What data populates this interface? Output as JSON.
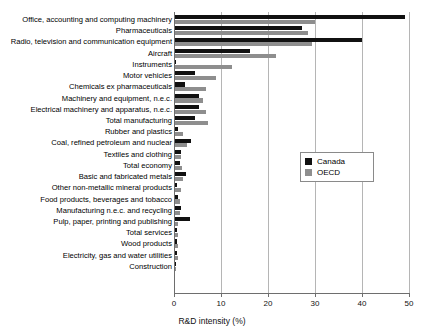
{
  "chart_data": {
    "type": "bar",
    "orientation": "horizontal",
    "title": "",
    "xlabel": "R&D intensity (%)",
    "ylabel": "",
    "xlim": [
      0,
      50
    ],
    "xticks": [
      0,
      10,
      20,
      30,
      40,
      50
    ],
    "xticklabels": [
      "0",
      "10",
      "20",
      "30",
      "40",
      "50"
    ],
    "grid": true,
    "grid_axis": "x",
    "legend_position": "center-right",
    "colors": {
      "Canada": "#111111",
      "OECD": "#8e8e8e"
    },
    "categories": [
      "Office, accounting and computing machinery",
      "Pharmaceuticals",
      "Radio, television and communication equipment",
      "Aircraft",
      "Instruments",
      "Motor vehicles",
      "Chemicals ex pharmaceuticals",
      "Machinery and equipment, n.e.c.",
      "Electrical machinery and apparatus, n.e.c.",
      "Total manufacturing",
      "Rubber and plastics",
      "Coal, refined petroleum and nuclear",
      "Textiles and clothing",
      "Total economy",
      "Basic and fabricated metals",
      "Other non-metallic mineral products",
      "Food products, beverages and tobacco",
      "Manufacturing n.e.c. and recycling",
      "Pulp, paper, printing and publishing",
      "Total services",
      "Wood products",
      "Electricity, gas and water utilities",
      "Construction"
    ],
    "series": [
      {
        "name": "Canada",
        "values": [
          49.0,
          27.0,
          39.8,
          16.0,
          0.3,
          4.2,
          2.2,
          5.0,
          5.0,
          4.2,
          0.7,
          3.5,
          1.2,
          1.0,
          2.4,
          0.4,
          0.7,
          1.3,
          3.2,
          0.5,
          0.5,
          0.5,
          0.15
        ]
      },
      {
        "name": "OECD",
        "values": [
          29.8,
          28.3,
          29.2,
          21.5,
          12.1,
          8.7,
          6.5,
          5.9,
          6.6,
          7.0,
          1.8,
          2.5,
          1.2,
          1.5,
          1.6,
          1.2,
          1.1,
          1.1,
          0.7,
          0.7,
          0.6,
          0.7,
          0.2
        ]
      }
    ],
    "legend": [
      {
        "label": "Canada",
        "color": "#111111"
      },
      {
        "label": "OECD",
        "color": "#8e8e8e"
      }
    ]
  }
}
